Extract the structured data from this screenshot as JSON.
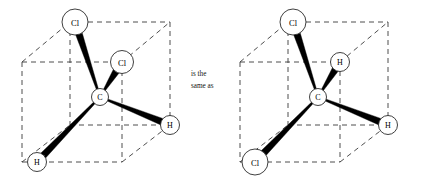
{
  "figure": {
    "caption_between": {
      "line1": "is the",
      "line2": "same as"
    },
    "background_color": "#ffffff",
    "bond_color": "#000000",
    "cube_edge_color": "#3a3a3a",
    "atom_fill_color": "#ffffff"
  },
  "structures": [
    {
      "id": "left",
      "name": "dichloromethane-tetrahedron-left",
      "center_atom": {
        "label": "C",
        "cx": 100,
        "cy": 97,
        "r": 8.5
      },
      "substituents": [
        {
          "label": "Cl",
          "cx": 75,
          "cy": 22,
          "r": 13,
          "bond": "wedge"
        },
        {
          "label": "Cl",
          "cx": 122,
          "cy": 62,
          "r": 11.5,
          "bond": "wedge"
        },
        {
          "label": "H",
          "cx": 37,
          "cy": 162,
          "r": 9.5,
          "bond": "wedge"
        },
        {
          "label": "H",
          "cx": 170,
          "cy": 125,
          "r": 9.5,
          "bond": "wedge"
        }
      ],
      "cube": {
        "front_bottom_left": [
          22,
          162
        ],
        "front_bottom_right": [
          122,
          162
        ],
        "front_top_left": [
          22,
          62
        ],
        "front_top_right": [
          122,
          62
        ],
        "back_bottom_left": [
          70,
          125
        ],
        "back_bottom_right": [
          170,
          125
        ],
        "back_top_left": [
          70,
          22
        ],
        "back_top_right": [
          170,
          22
        ]
      }
    },
    {
      "id": "right",
      "name": "dichloromethane-tetrahedron-right",
      "center_atom": {
        "label": "C",
        "cx": 318,
        "cy": 97,
        "r": 8.5
      },
      "substituents": [
        {
          "label": "Cl",
          "cx": 293,
          "cy": 22,
          "r": 13,
          "bond": "wedge"
        },
        {
          "label": "H",
          "cx": 340,
          "cy": 62,
          "r": 9.5,
          "bond": "wedge"
        },
        {
          "label": "Cl",
          "cx": 255,
          "cy": 162,
          "r": 13,
          "bond": "wedge"
        },
        {
          "label": "H",
          "cx": 388,
          "cy": 125,
          "r": 9.5,
          "bond": "wedge"
        }
      ],
      "cube": {
        "front_bottom_left": [
          240,
          162
        ],
        "front_bottom_right": [
          340,
          162
        ],
        "front_top_left": [
          240,
          62
        ],
        "front_top_right": [
          340,
          62
        ],
        "back_bottom_left": [
          288,
          125
        ],
        "back_bottom_right": [
          388,
          125
        ],
        "back_top_left": [
          288,
          22
        ],
        "back_top_right": [
          388,
          22
        ]
      }
    }
  ]
}
